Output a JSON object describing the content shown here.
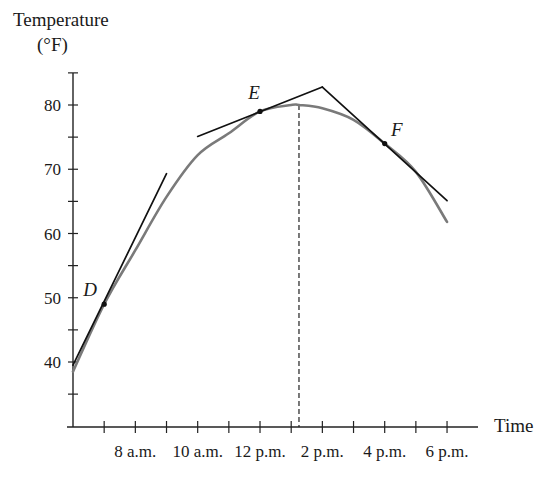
{
  "chart_data": {
    "type": "line",
    "title": "",
    "ylabel": "Temperature",
    "ylabel_unit": "(°F)",
    "xlabel": "Time",
    "x_tick_labels": [
      "8 a.m.",
      "10 a.m.",
      "12 p.m.",
      "2 p.m.",
      "4 p.m.",
      "6 p.m."
    ],
    "x_tick_hours": [
      8,
      10,
      12,
      14,
      16,
      18
    ],
    "x_range_hours": [
      6,
      18
    ],
    "x_minor_tick_every_hours": 1,
    "y_tick_labels": [
      "40",
      "50",
      "60",
      "70",
      "80"
    ],
    "y_ticks": [
      40,
      50,
      60,
      70,
      80
    ],
    "y_minor_tick_every": 5,
    "ylim": [
      30,
      85
    ],
    "grid": false,
    "legend": null,
    "series": [
      {
        "name": "Temperature curve",
        "color": "#7a7a7a",
        "x_hours": [
          6,
          7,
          8,
          9,
          10,
          11,
          12,
          13,
          13.25,
          14,
          15,
          16,
          17,
          18
        ],
        "values": [
          38.5,
          49,
          57.4,
          65.7,
          72.2,
          75.6,
          79,
          80,
          80,
          79.5,
          77.7,
          74,
          69.6,
          61.8
        ]
      }
    ],
    "points": [
      {
        "label": "D",
        "x_hours": 7,
        "value": 49
      },
      {
        "label": "E",
        "x_hours": 12,
        "value": 79
      },
      {
        "label": "F",
        "x_hours": 16,
        "value": 74
      }
    ],
    "tangent_lines": [
      {
        "at": "D",
        "from": [
          6,
          39.5
        ],
        "to": [
          9,
          69.3
        ]
      },
      {
        "at": "E",
        "from": [
          10,
          75.1
        ],
        "to": [
          14,
          82.8
        ]
      },
      {
        "at": "F",
        "from": [
          14,
          82.8
        ],
        "to": [
          18,
          65.1
        ]
      }
    ],
    "annotations": [
      {
        "type": "dashed-vertical",
        "x_hours": 13.25,
        "from_value": 80,
        "note": "maximum temperature"
      }
    ]
  }
}
